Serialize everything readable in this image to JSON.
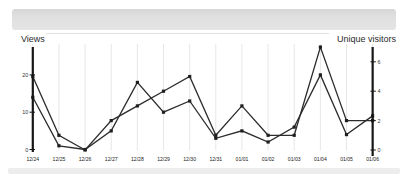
{
  "header": {
    "left_axis_title": "Views",
    "right_axis_title": "Unique visitors"
  },
  "chart_data": {
    "type": "line",
    "x": [
      "12/24",
      "12/25",
      "12/26",
      "12/27",
      "12/28",
      "12/29",
      "12/30",
      "12/31",
      "01/01",
      "01/02",
      "01/03",
      "01/04",
      "01/05",
      "01/06"
    ],
    "series": [
      {
        "name": "Views",
        "axis": "left",
        "values": [
          14,
          1,
          0,
          5,
          18,
          10,
          13,
          3,
          5,
          2,
          6,
          20,
          4,
          9
        ]
      },
      {
        "name": "Unique visitors",
        "axis": "right",
        "values": [
          5,
          1,
          0,
          2,
          3,
          4,
          5,
          1,
          3,
          1,
          1,
          7,
          2,
          2
        ]
      }
    ],
    "left_axis": {
      "label": "Views",
      "ticks": [
        0,
        10,
        20
      ],
      "range": [
        0,
        20
      ]
    },
    "right_axis": {
      "label": "Unique visitors",
      "ticks": [
        0,
        2,
        4,
        6
      ],
      "range": [
        0,
        7
      ]
    },
    "grid": "vertical-only",
    "legend": "none",
    "line_color": "#2c2c2c",
    "marker_color": "#1f1f1f",
    "axis_color": "#161616",
    "grid_color": "#e7e7e7",
    "tick_label_color": "#333333",
    "date_label_color": "#222222"
  }
}
